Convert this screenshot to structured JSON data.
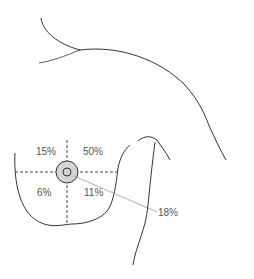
{
  "diagram": {
    "quadrants": {
      "upper_left": "15%",
      "upper_right": "50%",
      "lower_left": "6%",
      "lower_right": "11%",
      "nipple_areola": "18%"
    },
    "colors": {
      "outline": "#333333",
      "dashed": "#444444",
      "areola_fill": "#d4d4d4",
      "leader_line": "#999999",
      "label_text": "#555555"
    }
  }
}
